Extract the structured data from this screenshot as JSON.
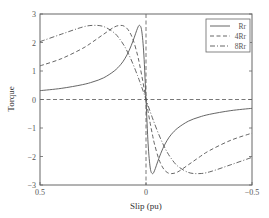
{
  "chart_data": {
    "type": "line",
    "title": "",
    "xlabel": "Slip (pu)",
    "ylabel": "Torque",
    "xlim": [
      0.5,
      -0.5
    ],
    "ylim": [
      -3,
      3
    ],
    "x_reversed": true,
    "grid": false,
    "legend_position": "upper right",
    "x_ticks": [
      0.5,
      0,
      -0.5
    ],
    "x_tick_labels": [
      "0.5",
      "0",
      "−0.5"
    ],
    "y_ticks": [
      3,
      2,
      1,
      0,
      -1,
      -2,
      -3
    ],
    "y_tick_labels": [
      "3",
      "2",
      "1",
      "0",
      "−1",
      "−2",
      "−3"
    ],
    "reference_lines": [
      {
        "orientation": "horizontal",
        "value": 0,
        "style": "dashed"
      },
      {
        "orientation": "vertical",
        "value": 0,
        "style": "dashed"
      }
    ],
    "x": [
      0.5,
      0.4,
      0.3,
      0.25,
      0.2,
      0.15,
      0.12,
      0.1,
      0.08,
      0.06,
      0.04,
      0.03,
      0.02,
      0.01,
      0,
      -0.01,
      -0.02,
      -0.03,
      -0.04,
      -0.06,
      -0.08,
      -0.1,
      -0.12,
      -0.15,
      -0.2,
      -0.25,
      -0.3,
      -0.4,
      -0.5
    ],
    "series": [
      {
        "name": "Rr",
        "style": "solid",
        "values": [
          0.31,
          0.39,
          0.52,
          0.62,
          0.76,
          1.0,
          1.22,
          1.43,
          1.71,
          2.08,
          2.5,
          2.6,
          2.4,
          1.56,
          0,
          -1.56,
          -2.4,
          -2.6,
          -2.5,
          -2.08,
          -1.71,
          -1.43,
          -1.22,
          -1.0,
          -0.76,
          -0.62,
          -0.52,
          -0.39,
          -0.31
        ]
      },
      {
        "name": "4Rr",
        "style": "dashed",
        "values": [
          1.18,
          1.43,
          1.79,
          2.03,
          2.29,
          2.54,
          2.6,
          2.56,
          2.4,
          2.08,
          1.56,
          1.22,
          0.84,
          0.43,
          0,
          -0.43,
          -0.84,
          -1.22,
          -1.56,
          -2.08,
          -2.4,
          -2.56,
          -2.6,
          -2.54,
          -2.29,
          -2.03,
          -1.79,
          -1.43,
          -1.18
        ]
      },
      {
        "name": "8Rr",
        "style": "dashdot",
        "values": [
          2.03,
          2.29,
          2.54,
          2.6,
          2.56,
          2.34,
          2.08,
          1.85,
          1.56,
          1.22,
          0.84,
          0.64,
          0.43,
          0.22,
          0,
          -0.22,
          -0.43,
          -0.64,
          -0.84,
          -1.22,
          -1.56,
          -1.85,
          -2.08,
          -2.34,
          -2.56,
          -2.6,
          -2.54,
          -2.29,
          -2.03
        ]
      }
    ]
  },
  "colors": {
    "line": "#555555",
    "frame": "#666666",
    "text": "#444444"
  },
  "legend": {
    "items": [
      "Rr",
      "4Rr",
      "8Rr"
    ]
  }
}
